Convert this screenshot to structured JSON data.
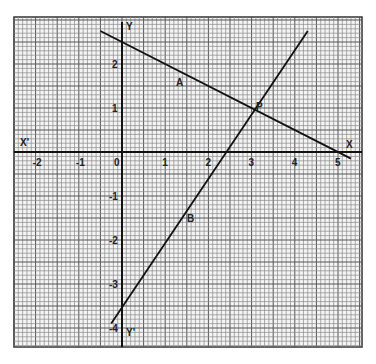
{
  "chart_data": {
    "type": "line",
    "title": "",
    "grid": true,
    "xlim": [
      -2.5,
      5.5
    ],
    "ylim": [
      -4.5,
      3
    ],
    "axis_labels": {
      "x_pos": "X",
      "x_neg": "X'",
      "y_pos": "Y",
      "y_neg": "Y'"
    },
    "x_ticks": [
      "-2",
      "-1",
      "0",
      "1",
      "2",
      "3",
      "4",
      "5"
    ],
    "y_ticks": [
      "2",
      "1",
      "-1",
      "-2",
      "-3",
      "-4"
    ],
    "series": [
      {
        "name": "A",
        "points": [
          [
            -0.5,
            2.75
          ],
          [
            5.3,
            -0.15
          ]
        ],
        "equation": "x + 2y = 5"
      },
      {
        "name": "B",
        "points": [
          [
            -0.25,
            -3.9
          ],
          [
            4.3,
            2.75
          ]
        ],
        "equation": "3x - 2y = 7"
      }
    ],
    "annotations": [
      {
        "label": "A",
        "x": 1.35,
        "y": 1.6
      },
      {
        "label": "B",
        "x": 1.6,
        "y": -1.5
      },
      {
        "label": "P",
        "x": 3,
        "y": 1,
        "note": "intersection point"
      }
    ]
  },
  "labels": {
    "A": "A",
    "B": "B",
    "P": "P",
    "X": "X",
    "Xp": "X'",
    "Y": "Y",
    "Yp": "Y'"
  }
}
